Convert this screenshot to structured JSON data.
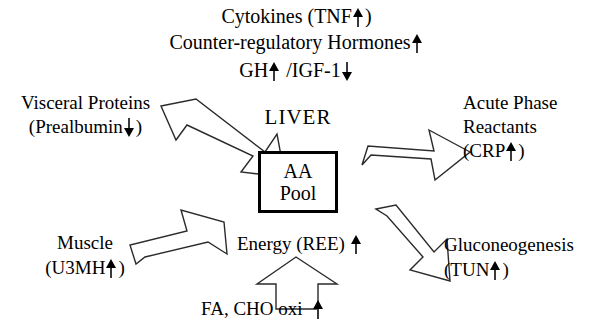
{
  "figure": {
    "center": {
      "organ_label": "LIVER",
      "box_line1": "AA",
      "box_line2": "Pool"
    },
    "top_block": {
      "line1_text": "Cytokines (TNF",
      "line1_arrow": "up",
      "line1_tail": ")",
      "line2_text": "Counter-regulatory Hormones",
      "line2_arrow": "up",
      "line3_a": "GH",
      "line3_arrow1": "up",
      "line3_b": "/IGF-1",
      "line3_arrow2": "down"
    },
    "left_top": {
      "line1": "Visceral Proteins",
      "line2_pre": "(Prealbumin",
      "line2_arrow": "down",
      "line2_post": ")"
    },
    "left_bottom": {
      "line1": "Muscle",
      "line2_pre": "(U3MH",
      "line2_arrow": "up",
      "line2_post": ")"
    },
    "right_top": {
      "line1": "Acute Phase",
      "line2": "Reactants",
      "line3_pre": "(CRP",
      "line3_arrow": "up",
      "line3_post": ")"
    },
    "right_bottom": {
      "line1": "Gluconeogenesis",
      "line2_pre": "(TUN",
      "line2_arrow": "up",
      "line2_post": ")"
    },
    "center_bottom": {
      "energy_text": "Energy (REE)",
      "energy_arrow": "up"
    },
    "bottom": {
      "text": "FA, CHO oxi",
      "arrow": "up"
    },
    "colors": {
      "background": "#ffffff",
      "text": "#000000",
      "arrow_stroke": "#2b2b2b",
      "arrow_fill": "#ffffff",
      "box_border": "#000000"
    }
  }
}
